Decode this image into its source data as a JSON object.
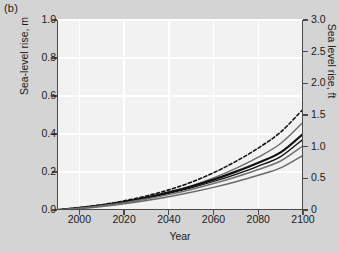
{
  "panel": {
    "label": "(b)"
  },
  "chart_data": {
    "type": "line",
    "title": "",
    "panel_label": "(b)",
    "xlabel": "Year",
    "ylabel": "Sea-level rise, m",
    "ylabel_right": "Sea level rise, ft",
    "xlim": [
      1990,
      2100
    ],
    "ylim": [
      0.0,
      1.0
    ],
    "ylim_right": [
      0.0,
      3.0
    ],
    "grid": true,
    "legend": "none",
    "xticks": [
      2000,
      2020,
      2040,
      2060,
      2080,
      2100
    ],
    "xticklabels": [
      "2000",
      "2020",
      "2040",
      "2060",
      "2080",
      "2100"
    ],
    "yticks": [
      0.0,
      0.2,
      0.4,
      0.6,
      0.8,
      1.0
    ],
    "yticklabels": [
      "0.0",
      "0.2",
      "0.4",
      "0.6",
      "0.8",
      "1.0"
    ],
    "yticks_right": [
      0.0,
      0.5,
      1.0,
      1.5,
      2.0,
      2.5,
      3.0
    ],
    "yticklabels_right": [
      "0",
      "0.5",
      "1.0",
      "1.5",
      "2.0",
      "2.5",
      "3.0"
    ],
    "x": [
      1990,
      2000,
      2010,
      2020,
      2030,
      2040,
      2050,
      2060,
      2070,
      2080,
      2090,
      2100
    ],
    "series": [
      {
        "name": "scenario-dashed-upper",
        "style": "dashed",
        "color": "#111111",
        "width": 1.6,
        "values": [
          0.0,
          0.012,
          0.028,
          0.048,
          0.074,
          0.106,
          0.146,
          0.196,
          0.256,
          0.326,
          0.41,
          0.53
        ]
      },
      {
        "name": "scenario-gray-upper",
        "style": "solid",
        "color": "#6f6f6f",
        "width": 1.5,
        "values": [
          0.0,
          0.01,
          0.024,
          0.042,
          0.065,
          0.093,
          0.127,
          0.169,
          0.219,
          0.278,
          0.35,
          0.462
        ]
      },
      {
        "name": "scenario-black-thick",
        "style": "solid",
        "color": "#111111",
        "width": 2.2,
        "values": [
          0.0,
          0.011,
          0.025,
          0.043,
          0.066,
          0.093,
          0.124,
          0.16,
          0.202,
          0.249,
          0.303,
          0.4
        ]
      },
      {
        "name": "scenario-black-thin",
        "style": "solid",
        "color": "#111111",
        "width": 1.3,
        "values": [
          0.0,
          0.01,
          0.024,
          0.041,
          0.063,
          0.088,
          0.117,
          0.15,
          0.188,
          0.231,
          0.281,
          0.372
        ]
      },
      {
        "name": "scenario-gray-mid",
        "style": "solid",
        "color": "#707070",
        "width": 1.5,
        "values": [
          0.0,
          0.009,
          0.022,
          0.038,
          0.058,
          0.081,
          0.108,
          0.139,
          0.174,
          0.213,
          0.258,
          0.338
        ]
      },
      {
        "name": "scenario-gray-lower",
        "style": "solid",
        "color": "#6a6a6a",
        "width": 1.5,
        "values": [
          0.0,
          0.008,
          0.019,
          0.033,
          0.05,
          0.07,
          0.093,
          0.119,
          0.149,
          0.183,
          0.222,
          0.288
        ]
      }
    ]
  }
}
